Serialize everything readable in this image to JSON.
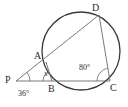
{
  "figure": {
    "type": "circle-geometry-diagram",
    "background_color": "#ffffff",
    "stroke_color": "#3a3a3a",
    "circle": {
      "name": "main-circle",
      "center_x": 81,
      "center_y": 51,
      "radius": 39
    },
    "points": [
      {
        "id": "P",
        "label": "P",
        "x": 16,
        "y": 81,
        "label_x": 5,
        "label_y": 75,
        "on_circle": false
      },
      {
        "id": "A",
        "label": "A",
        "x": 46,
        "y": 62,
        "label_x": 34,
        "label_y": 51,
        "on_circle": true
      },
      {
        "id": "B",
        "label": "B",
        "x": 52,
        "y": 81,
        "label_x": 48,
        "label_y": 84,
        "on_circle": true
      },
      {
        "id": "C",
        "label": "C",
        "x": 110,
        "y": 81,
        "label_x": 110,
        "label_y": 83,
        "on_circle": true
      },
      {
        "id": "D",
        "label": "D",
        "x": 99,
        "y": 15,
        "label_x": 92,
        "label_y": 3,
        "on_circle": true
      }
    ],
    "segments": [
      {
        "id": "PD",
        "from": "P",
        "to": "D",
        "name": "secant-p-d"
      },
      {
        "id": "PC",
        "from": "P",
        "to": "C",
        "name": "secant-p-c"
      },
      {
        "id": "DC",
        "from": "D",
        "to": "C",
        "name": "chord-d-c"
      },
      {
        "id": "AB",
        "from": "A",
        "to": "B",
        "name": "chord-a-b"
      }
    ],
    "angles": [
      {
        "id": "angle-P",
        "vertex": "P",
        "value": "36",
        "text": "36°",
        "label_x": 18,
        "label_y": 90,
        "arc_radius": 14
      },
      {
        "id": "angle-B",
        "vertex": "B",
        "value": "x",
        "text": "x",
        "label_x": 44,
        "label_y": 70,
        "arc_radius": 9
      },
      {
        "id": "angle-C",
        "vertex": "C",
        "value": "80",
        "text": "80°",
        "label_x": 79,
        "label_y": 64,
        "arc_radius": 13
      }
    ]
  }
}
